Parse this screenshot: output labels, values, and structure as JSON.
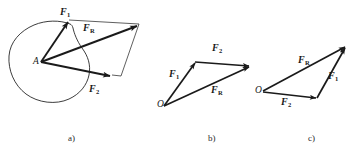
{
  "figure": {
    "background_color": "#ffffff",
    "stroke_color": "#1a1a1a",
    "width": 356,
    "height": 152,
    "panels": [
      {
        "id": "a",
        "caption": "a)",
        "caption_x": 68,
        "caption_y": 134,
        "description": "Parallelogram law: two forces applied at point A on a body outline, resultant along the diagonal",
        "point_labels": [
          {
            "name": "point-a",
            "text": "A",
            "x": 33,
            "y": 57
          }
        ],
        "vector_labels": [
          {
            "name": "force-1",
            "symbol": "F",
            "subscript": "1",
            "x": 60,
            "y": 7
          },
          {
            "name": "resultant-force",
            "symbol": "F",
            "subscript": "R",
            "x": 83,
            "y": 23
          },
          {
            "name": "force-2",
            "symbol": "F",
            "subscript": "2",
            "x": 89,
            "y": 84
          }
        ]
      },
      {
        "id": "b",
        "caption": "b)",
        "caption_x": 208,
        "caption_y": 134,
        "description": "Triangle rule: F1 then F2 head-to-tail from O, resultant FR closes the triangle",
        "point_labels": [
          {
            "name": "point-o",
            "text": "O",
            "x": 157,
            "y": 100
          }
        ],
        "vector_labels": [
          {
            "name": "force-1",
            "symbol": "F",
            "subscript": "1",
            "x": 169,
            "y": 69
          },
          {
            "name": "force-2",
            "symbol": "F",
            "subscript": "2",
            "x": 212,
            "y": 43
          },
          {
            "name": "resultant-force",
            "symbol": "F",
            "subscript": "R",
            "x": 211,
            "y": 85
          }
        ]
      },
      {
        "id": "c",
        "caption": "c)",
        "caption_x": 308,
        "caption_y": 134,
        "description": "Triangle rule with order reversed: F2 then F1 head-to-tail from O, resultant FR closes the triangle",
        "point_labels": [
          {
            "name": "point-o",
            "text": "O",
            "x": 255,
            "y": 86
          }
        ],
        "vector_labels": [
          {
            "name": "resultant-force",
            "symbol": "F",
            "subscript": "R",
            "x": 298,
            "y": 55
          },
          {
            "name": "force-1",
            "symbol": "F",
            "subscript": "1",
            "x": 328,
            "y": 71
          },
          {
            "name": "force-2",
            "symbol": "F",
            "subscript": "2",
            "x": 281,
            "y": 97
          }
        ]
      }
    ]
  }
}
